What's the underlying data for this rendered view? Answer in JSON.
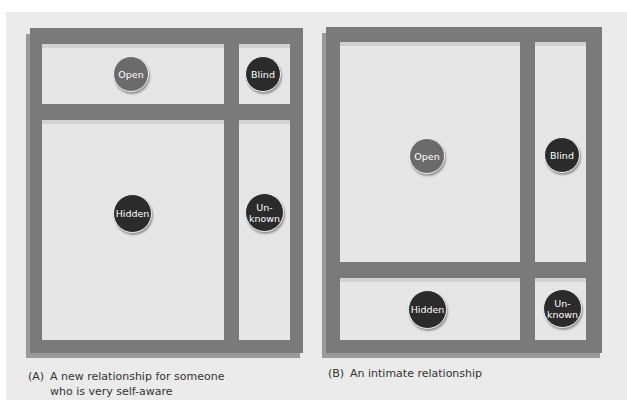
{
  "panels": {
    "a": {
      "label": "(A)",
      "caption_line1": "A new relationship for someone",
      "caption_line2": "who is very self-aware",
      "quadrants": {
        "open": "Open",
        "blind": "Blind",
        "hidden": "Hidden",
        "unknown_line1": "Un-",
        "unknown_line2": "known"
      }
    },
    "b": {
      "label": "(B)",
      "caption_line1": "An intimate relationship",
      "quadrants": {
        "open": "Open",
        "blind": "Blind",
        "hidden": "Hidden",
        "unknown_line1": "Un-",
        "unknown_line2": "known"
      }
    }
  },
  "colors": {
    "frame": "#7a7a7a",
    "cell": "#e6e6e6",
    "open_circle": "#6b6b6b",
    "dark_circle": "#2b2b2b",
    "background": "#ebebeb"
  }
}
